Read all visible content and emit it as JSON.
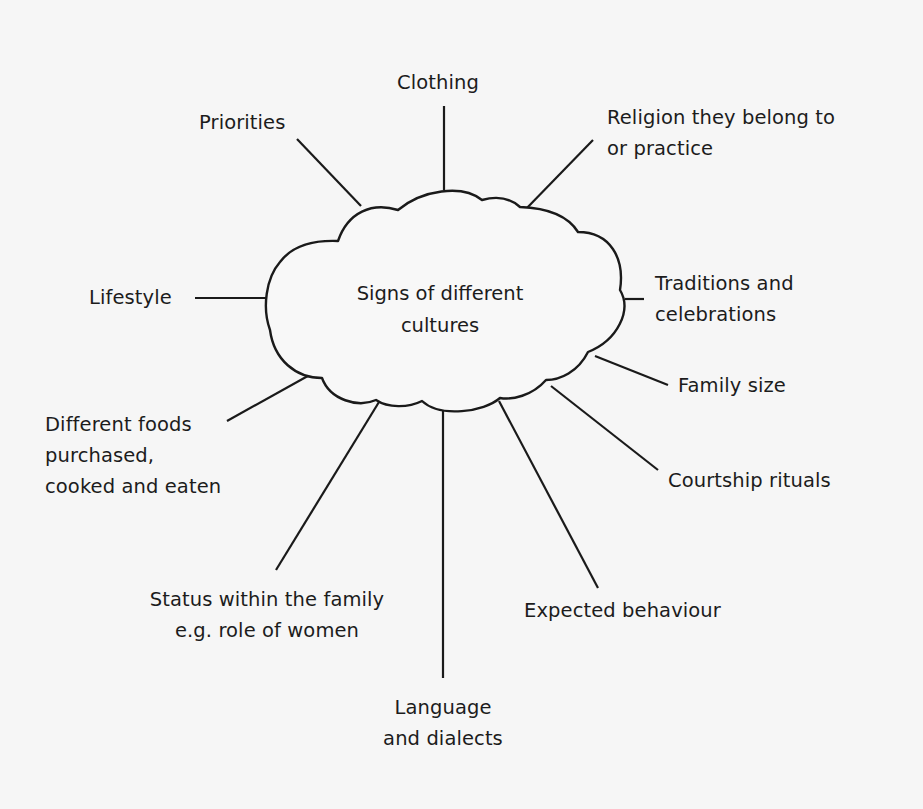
{
  "diagram": {
    "center": {
      "lines": [
        "Signs of different",
        "cultures"
      ]
    },
    "nodes": [
      {
        "id": "clothing",
        "lines": [
          "Clothing"
        ]
      },
      {
        "id": "priorities",
        "lines": [
          "Priorities"
        ]
      },
      {
        "id": "religion",
        "lines": [
          "Religion they belong to",
          "or practice"
        ]
      },
      {
        "id": "lifestyle",
        "lines": [
          "Lifestyle"
        ]
      },
      {
        "id": "traditions",
        "lines": [
          "Traditions and",
          "celebrations"
        ]
      },
      {
        "id": "family-size",
        "lines": [
          "Family size"
        ]
      },
      {
        "id": "different-foods",
        "lines": [
          "Different foods",
          "purchased,",
          "cooked and eaten"
        ]
      },
      {
        "id": "courtship",
        "lines": [
          "Courtship rituals"
        ]
      },
      {
        "id": "status",
        "lines": [
          "Status within the family",
          "e.g. role of women"
        ]
      },
      {
        "id": "expected-behaviour",
        "lines": [
          "Expected behaviour"
        ]
      },
      {
        "id": "language",
        "lines": [
          "Language",
          "and dialects"
        ]
      }
    ],
    "colors": {
      "background": "#f6f6f6",
      "ink": "#1a1a1a"
    }
  }
}
